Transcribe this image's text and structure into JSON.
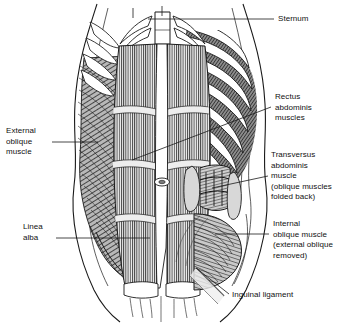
{
  "figure": {
    "style": {
      "background": "#ffffff",
      "ink": "#1a1a1a",
      "muscle_fill": "#8e8e8e",
      "bone_fill": "#ffffff",
      "text_color": "#111111"
    }
  },
  "labels": [
    {
      "id": "sternum",
      "name": "label-sternum",
      "side": "right",
      "lines": [
        "Sternum"
      ],
      "x": 278,
      "y": 14,
      "leader": {
        "from": [
          274,
          19
        ],
        "to": [
          148,
          19
        ]
      }
    },
    {
      "id": "rectus-abdominis",
      "name": "label-rectus-abdominis",
      "side": "right",
      "lines": [
        "Rectus",
        "abdominis",
        "muscles"
      ],
      "x": 275,
      "y": 92,
      "leader": {
        "from": [
          271,
          107
        ],
        "to": [
          132,
          160
        ]
      }
    },
    {
      "id": "transversus-abdominis",
      "name": "label-transversus-abdominis",
      "side": "right",
      "lines": [
        "Transversus",
        "abdominis",
        "muscle",
        "(oblique muscles",
        "folded back)"
      ],
      "x": 271,
      "y": 150,
      "leader": {
        "from": [
          268,
          176
        ],
        "to": [
          212,
          188
        ]
      }
    },
    {
      "id": "internal-oblique",
      "name": "label-internal-oblique",
      "side": "right",
      "lines": [
        "Internal",
        "oblique muscle",
        "(external oblique",
        "removed)"
      ],
      "x": 273,
      "y": 219,
      "leader": {
        "from": [
          269,
          234
        ],
        "to": [
          215,
          234
        ]
      }
    },
    {
      "id": "inguinal-ligament",
      "name": "label-inguinal-ligament",
      "side": "right",
      "lines": [
        "Inguinal ligament"
      ],
      "x": 232,
      "y": 290,
      "leader": {
        "from": [
          229,
          294
        ],
        "to": [
          196,
          268
        ]
      }
    },
    {
      "id": "external-oblique",
      "name": "label-external-oblique",
      "side": "left",
      "lines": [
        "External",
        "oblique",
        "muscle"
      ],
      "x": 6,
      "y": 126,
      "leader": {
        "from": [
          52,
          142
        ],
        "to": [
          98,
          142
        ]
      }
    },
    {
      "id": "linea-alba",
      "name": "label-linea-alba",
      "side": "left",
      "lines": [
        "Linea",
        "alba"
      ],
      "x": 23,
      "y": 222,
      "leader": {
        "from": [
          56,
          238
        ],
        "to": [
          150,
          238
        ]
      }
    }
  ],
  "anatomy": {
    "structures": [
      {
        "id": "sternum",
        "label": "Sternum",
        "type": "bone"
      },
      {
        "id": "ribs",
        "label": "Ribs and costal cartilage",
        "type": "bone",
        "count": 7
      },
      {
        "id": "rectus-abdominis",
        "label": "Rectus abdominis muscles",
        "type": "muscle"
      },
      {
        "id": "linea-alba",
        "label": "Linea alba",
        "type": "aponeurosis"
      },
      {
        "id": "tendinous-intersections",
        "label": "Tendinous intersections",
        "type": "aponeurosis",
        "count": 3
      },
      {
        "id": "navel",
        "label": "Umbilicus",
        "type": "landmark"
      },
      {
        "id": "external-oblique",
        "label": "External oblique muscle",
        "type": "muscle"
      },
      {
        "id": "internal-oblique",
        "label": "Internal oblique muscle",
        "type": "muscle"
      },
      {
        "id": "transversus-abdominis",
        "label": "Transversus abdominis muscle",
        "type": "muscle"
      },
      {
        "id": "inguinal-ligament",
        "label": "Inguinal ligament",
        "type": "ligament"
      },
      {
        "id": "pubic-attachment",
        "label": "Pubic attachment",
        "type": "bone"
      }
    ]
  }
}
